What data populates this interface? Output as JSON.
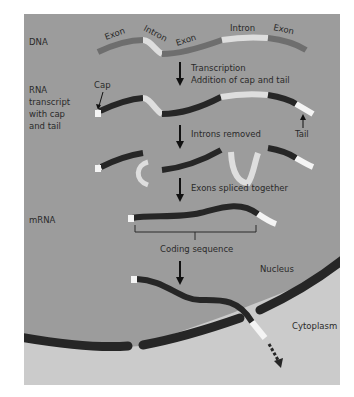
{
  "diagram": {
    "type": "gene-expression-rna-processing",
    "colors": {
      "nucleus_bg": "#9c9c9c",
      "cytoplasm_bg": "#cbcbcb",
      "exon_dna": "#6e6e6e",
      "intron_light": "#dedede",
      "exon_rna": "#262626",
      "envelope": "#262626",
      "cap_tail": "#f4f4f4",
      "text": "#2a2a2a"
    },
    "row_labels": {
      "dna": "DNA",
      "rna_line1": "RNA",
      "rna_line2": "transcript",
      "rna_line3": "with cap",
      "rna_line4": "and tail",
      "mrna": "mRNA"
    },
    "dna_segments": {
      "exon1": "Exon",
      "intron1": "Intron",
      "exon2": "Exon",
      "intron2": "Intron",
      "exon3": "Exon"
    },
    "steps": {
      "step1_line1": "Transcription",
      "step1_line2": "Addition of cap and tail",
      "step2": "Introns removed",
      "step3": "Exons spliced together"
    },
    "annotations": {
      "cap": "Cap",
      "tail": "Tail",
      "coding_sequence": "Coding sequence",
      "nucleus": "Nucleus",
      "cytoplasm": "Cytoplasm"
    }
  }
}
